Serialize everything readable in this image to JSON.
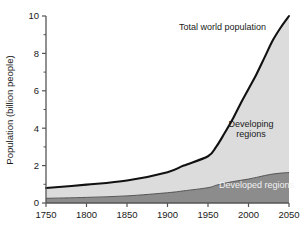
{
  "chart_data": {
    "type": "area",
    "title": "",
    "xlabel": "",
    "ylabel": "Population (billion people)",
    "xlim": [
      1750,
      2050
    ],
    "ylim": [
      0,
      10
    ],
    "xticks": [
      1750,
      1800,
      1850,
      1900,
      1950,
      2000,
      2050
    ],
    "xtick_labels": [
      "1750",
      "1800",
      "1850",
      "1900",
      "1950",
      "2000",
      "2050"
    ],
    "yticks": [
      0,
      2,
      4,
      6,
      8,
      10
    ],
    "ytick_labels": [
      "0",
      "2",
      "4",
      "6",
      "8",
      "10"
    ],
    "yminor_ticks": [
      1,
      3,
      5,
      7,
      9
    ],
    "grid": false,
    "legend_position": "inline-annotations",
    "x": [
      1750,
      1800,
      1850,
      1900,
      1920,
      1950,
      1960,
      1970,
      1980,
      1990,
      2000,
      2010,
      2020,
      2030,
      2040,
      2050
    ],
    "series": [
      {
        "name": "Developed regions",
        "stack_order": 1,
        "color": "#8c8c8c",
        "values": [
          0.25,
          0.3,
          0.38,
          0.55,
          0.65,
          0.82,
          0.95,
          1.05,
          1.14,
          1.21,
          1.28,
          1.37,
          1.47,
          1.55,
          1.6,
          1.63
        ]
      },
      {
        "name": "Developing regions",
        "stack_order": 2,
        "color": "#dcdcdc",
        "values": [
          0.55,
          0.68,
          0.82,
          1.1,
          1.35,
          1.68,
          2.05,
          2.65,
          3.31,
          4.09,
          4.82,
          5.53,
          6.33,
          7.15,
          7.8,
          8.37
        ]
      }
    ],
    "total_line": {
      "name": "Total world population",
      "color": "#111111",
      "values": [
        0.8,
        0.98,
        1.2,
        1.65,
        2.0,
        2.5,
        3.0,
        3.7,
        4.45,
        5.3,
        6.1,
        6.9,
        7.8,
        8.7,
        9.4,
        10.0
      ]
    },
    "annotations": [
      {
        "id": "total-world-population",
        "text": "Total world population",
        "x": 1968,
        "y": 9.25,
        "style": "dark"
      },
      {
        "id": "developing-regions-line1",
        "text": "Developing",
        "x": 2003,
        "y": 4.05,
        "style": "dark"
      },
      {
        "id": "developing-regions-line2",
        "text": "regions",
        "x": 2003,
        "y": 3.55,
        "style": "dark"
      },
      {
        "id": "developed-regions",
        "text": "Developed regions",
        "x": 2010,
        "y": 0.78,
        "style": "light"
      }
    ]
  },
  "figure": {
    "background_color": "#ffffff",
    "axis_color": "#555555",
    "developed_color": "#8c8c8c",
    "developing_color": "#dcdcdc",
    "line_color": "#111111"
  }
}
